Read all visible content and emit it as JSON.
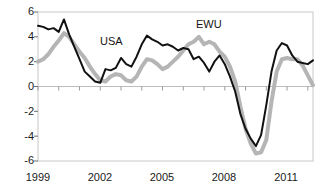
{
  "chart_data": {
    "type": "line",
    "title": "",
    "subtitle": "",
    "xlabel": "",
    "ylabel": "",
    "xlim": [
      1999.0,
      2012.25
    ],
    "ylim": [
      -6,
      6
    ],
    "grid": false,
    "legend_position": "inline-annotation",
    "y_ticks": [
      6,
      4,
      2,
      0,
      -2,
      -4,
      -6
    ],
    "y_tick_labels": [
      "6",
      "4",
      "2",
      "0",
      "-2",
      "-4",
      "-6"
    ],
    "x_ticks": [
      1999,
      2002,
      2005,
      2008,
      2011
    ],
    "x_tick_labels": [
      "1999",
      "2002",
      "2005",
      "2008",
      "2011"
    ],
    "x_minor_tick_step": 1,
    "annotations": [
      {
        "text": "USA",
        "x": 2002.6,
        "y": 3.05,
        "color": "#141414"
      },
      {
        "text": "EWU",
        "x": 2007.1,
        "y": 4.75,
        "color": "#141414"
      }
    ],
    "series": [
      {
        "name": "USA",
        "color": "#111111",
        "line_width": 2.0,
        "x": [
          1999.0,
          1999.25,
          1999.5,
          1999.75,
          2000.0,
          2000.25,
          2000.5,
          2000.75,
          2001.0,
          2001.25,
          2001.5,
          2001.75,
          2002.0,
          2002.25,
          2002.5,
          2002.75,
          2003.0,
          2003.25,
          2003.5,
          2003.75,
          2004.0,
          2004.25,
          2004.5,
          2004.75,
          2005.0,
          2005.25,
          2005.5,
          2005.75,
          2006.0,
          2006.25,
          2006.5,
          2006.75,
          2007.0,
          2007.25,
          2007.5,
          2007.75,
          2008.0,
          2008.25,
          2008.5,
          2008.75,
          2009.0,
          2009.25,
          2009.5,
          2009.75,
          2010.0,
          2010.25,
          2010.5,
          2010.75,
          2011.0,
          2011.25,
          2011.5,
          2011.75,
          2012.0,
          2012.25
        ],
        "y": [
          4.9,
          4.8,
          4.6,
          4.7,
          4.4,
          5.4,
          4.2,
          3.2,
          2.2,
          1.2,
          0.8,
          0.4,
          0.3,
          1.4,
          1.3,
          1.5,
          2.3,
          1.8,
          1.6,
          2.4,
          3.4,
          4.1,
          3.8,
          3.6,
          3.3,
          3.4,
          3.2,
          2.9,
          3.1,
          3.0,
          2.2,
          2.4,
          1.9,
          1.2,
          2.0,
          2.5,
          1.8,
          0.8,
          -0.4,
          -2.2,
          -3.4,
          -4.2,
          -4.8,
          -3.9,
          -1.5,
          1.2,
          2.9,
          3.5,
          3.3,
          2.5,
          2.0,
          1.9,
          1.8,
          2.1
        ]
      },
      {
        "name": "EWU",
        "color": "#b5b5b5",
        "line_width": 4.0,
        "x": [
          1999.0,
          1999.25,
          1999.5,
          1999.75,
          2000.0,
          2000.25,
          2000.5,
          2000.75,
          2001.0,
          2001.25,
          2001.5,
          2001.75,
          2002.0,
          2002.25,
          2002.5,
          2002.75,
          2003.0,
          2003.25,
          2003.5,
          2003.75,
          2004.0,
          2004.25,
          2004.5,
          2004.75,
          2005.0,
          2005.25,
          2005.5,
          2005.75,
          2006.0,
          2006.25,
          2006.5,
          2006.75,
          2007.0,
          2007.25,
          2007.5,
          2007.75,
          2008.0,
          2008.25,
          2008.5,
          2008.75,
          2009.0,
          2009.25,
          2009.5,
          2009.75,
          2010.0,
          2010.25,
          2010.5,
          2010.75,
          2011.0,
          2011.25,
          2011.5,
          2011.75,
          2012.0,
          2012.25
        ],
        "y": [
          2.0,
          2.2,
          2.6,
          3.2,
          3.7,
          4.3,
          4.0,
          3.4,
          2.8,
          2.3,
          1.6,
          1.0,
          0.5,
          0.4,
          0.8,
          1.0,
          0.9,
          0.5,
          0.4,
          0.8,
          1.6,
          2.2,
          2.1,
          1.8,
          1.4,
          1.6,
          2.0,
          2.4,
          2.9,
          3.4,
          3.6,
          4.0,
          3.4,
          3.6,
          3.4,
          2.8,
          2.4,
          1.6,
          0.4,
          -1.6,
          -3.4,
          -4.6,
          -5.4,
          -5.3,
          -4.3,
          -1.2,
          1.2,
          2.2,
          2.3,
          2.2,
          2.2,
          1.7,
          0.9,
          0.1
        ]
      }
    ]
  },
  "axes": {
    "y_labels": [
      "6",
      "4",
      "2",
      "0",
      "-2",
      "-4",
      "-6"
    ],
    "x_labels": [
      "1999",
      "2002",
      "2005",
      "2008",
      "2011"
    ]
  },
  "labels": {
    "usa": "USA",
    "ewu": "EWU"
  }
}
